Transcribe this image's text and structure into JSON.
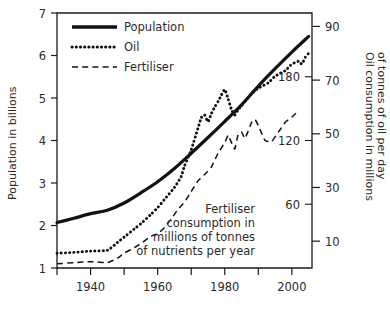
{
  "chart_data": {
    "type": "line",
    "title": "",
    "xlabel": "",
    "xlim": [
      1930,
      2006
    ],
    "xticks": [
      1930,
      1940,
      1950,
      1960,
      1970,
      1980,
      1990,
      2000
    ],
    "xticklabels": [
      "",
      "1940",
      "",
      "1960",
      "",
      "1980",
      "",
      "2000"
    ],
    "grid": false,
    "legend_position": "top-left",
    "axes": {
      "left": {
        "label": "Population in billions",
        "lim": [
          1,
          7
        ],
        "ticks": [
          1,
          2,
          3,
          4,
          5,
          6,
          7
        ],
        "ticklabels": [
          "1",
          "2",
          "3",
          "4",
          "5",
          "6",
          "7"
        ]
      },
      "right_outer": {
        "label": "Oil consumption in millions of tonnes of oil per day",
        "label_line1": "Oil consumption in millions",
        "label_line2": "of tonnes of oil per day",
        "lim": [
          0,
          95
        ],
        "ticks": [
          10,
          30,
          50,
          70,
          90
        ],
        "ticklabels": [
          "10",
          "30",
          "50",
          "70",
          "90"
        ]
      },
      "right_inner": {
        "label": "Fertiliser consumption in millions of tonnes of nutrients per year",
        "label_line1": "Fertiliser",
        "label_line2": "consumption in",
        "label_line3": "millions of tonnes",
        "label_line4": "of nutrients per year",
        "lim": [
          0,
          240
        ],
        "ticks": [
          60,
          120,
          180
        ],
        "ticklabels": [
          "60",
          "120",
          "180"
        ]
      }
    },
    "series": [
      {
        "name": "Population",
        "style": "solid",
        "axis": "left",
        "unit": "billions",
        "x": [
          1930,
          1935,
          1940,
          1945,
          1950,
          1955,
          1960,
          1965,
          1970,
          1975,
          1980,
          1985,
          1990,
          1995,
          2000,
          2005
        ],
        "values": [
          2.07,
          2.17,
          2.28,
          2.36,
          2.53,
          2.77,
          3.03,
          3.34,
          3.7,
          4.07,
          4.45,
          4.84,
          5.28,
          5.69,
          6.08,
          6.45
        ]
      },
      {
        "name": "Oil",
        "style": "dotted",
        "axis": "right_outer",
        "unit": "millions of tonnes of oil per day",
        "x": [
          1930,
          1935,
          1940,
          1945,
          1948,
          1950,
          1953,
          1955,
          1958,
          1960,
          1962,
          1965,
          1967,
          1968,
          1970,
          1972,
          1973,
          1974,
          1975,
          1976,
          1977,
          1978,
          1979,
          1980,
          1981,
          1982,
          1983,
          1984,
          1985,
          1988,
          1990,
          1993,
          1995,
          1998,
          2000,
          2001,
          2002,
          2003,
          2004,
          2005
        ],
        "values": [
          5.5,
          5.8,
          6.3,
          6.6,
          9.5,
          11.5,
          14.5,
          16.5,
          20.0,
          22.5,
          25.5,
          30.0,
          34.0,
          38.0,
          44.0,
          52.0,
          56.0,
          57.0,
          54.5,
          57.5,
          60.0,
          62.0,
          64.5,
          66.5,
          63.0,
          59.0,
          57.0,
          59.0,
          60.5,
          65.0,
          67.0,
          69.0,
          71.5,
          73.5,
          76.0,
          76.5,
          77.0,
          76.0,
          78.5,
          80.0
        ]
      },
      {
        "name": "Fertiliser",
        "style": "dashed",
        "axis": "right_inner",
        "unit": "millions of tonnes of nutrients per year",
        "x": [
          1930,
          1935,
          1940,
          1945,
          1948,
          1950,
          1953,
          1955,
          1958,
          1960,
          1962,
          1964,
          1966,
          1968,
          1970,
          1972,
          1974,
          1976,
          1978,
          1980,
          1981,
          1982,
          1983,
          1984,
          1985,
          1986,
          1987,
          1988,
          1989,
          1990,
          1992,
          1994,
          1996,
          1998,
          2000,
          2002
        ],
        "values": [
          4,
          5,
          6,
          5,
          9,
          14,
          19,
          23,
          30,
          32,
          38,
          46,
          55,
          62,
          72,
          82,
          88,
          95,
          108,
          118,
          125,
          118,
          112,
          126,
          128,
          122,
          129,
          137,
          140,
          134,
          120,
          119,
          128,
          137,
          142,
          148
        ]
      }
    ],
    "legend": [
      {
        "label": "Population",
        "style": "solid"
      },
      {
        "label": "Oil",
        "style": "dotted"
      },
      {
        "label": "Fertiliser",
        "style": "dashed"
      }
    ]
  }
}
